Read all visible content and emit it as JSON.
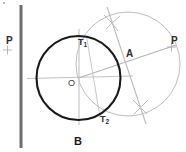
{
  "figure": {
    "caption": "B",
    "labels": {
      "p_left": "P",
      "p_right": "P",
      "a": "A",
      "o": "O",
      "t1_base": "T",
      "t1_sub": "1",
      "t2_base": "T",
      "t2_sub": "2"
    },
    "colors": {
      "main_circle": "#1a1a1a",
      "construction": "#b0b0b0",
      "construction_light": "#c4c4c4",
      "vertical_line": "#6e6e6e",
      "text": "#2b2b2b",
      "background": "#ffffff"
    },
    "geometry": {
      "vertical_line": {
        "x": 21,
        "y_top": 5,
        "y_bottom": 148,
        "width": 3
      },
      "main_circle": {
        "cx": 78.5,
        "cy": 78,
        "r": 42,
        "stroke_width": 2.1
      },
      "construction_circle": {
        "cx": 128,
        "cy": 64,
        "r": 52,
        "stroke_width": 1
      },
      "points": {
        "O": {
          "x": 78.5,
          "y": 78
        },
        "A": {
          "x": 124,
          "y": 59
        },
        "P_left": {
          "x": 7,
          "y": 50
        },
        "P_right": {
          "x": 171,
          "y": 47
        },
        "T1": {
          "x": 88,
          "y": 38
        },
        "T2": {
          "x": 99,
          "y": 115
        },
        "arc_x_top": {
          "x": 112,
          "y": 22
        },
        "arc_x_bottom": {
          "x": 140,
          "y": 107
        }
      },
      "lines": {
        "op_ray": {
          "x1": 78.5,
          "y1": 78,
          "x2": 174,
          "y2": 46
        },
        "horizontal_axis": {
          "x1": 27,
          "y1": 78,
          "x2": 131,
          "y2": 76
        },
        "vertical_axis": {
          "x1": 79,
          "y1": 29,
          "x2": 79,
          "y2": 124
        },
        "bisector": {
          "x1": 108,
          "y1": 8,
          "x2": 145,
          "y2": 122
        },
        "tangent_chord": {
          "x1": 88,
          "y1": 38,
          "x2": 99,
          "y2": 115
        }
      }
    }
  }
}
